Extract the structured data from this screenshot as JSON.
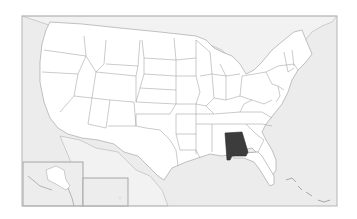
{
  "map": {
    "type": "locator-map",
    "region": "United States",
    "highlighted_state": "Alabama",
    "colors": {
      "highlight": "#3c3c3c",
      "land": "#ffffff",
      "water": "#ececec",
      "border": "#a0a0a0"
    },
    "insets": [
      "Alaska",
      "Hawaii"
    ]
  }
}
